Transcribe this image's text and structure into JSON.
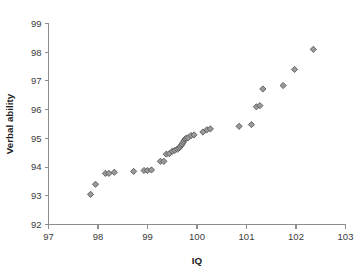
{
  "chart_data": {
    "type": "scatter",
    "title": "",
    "xlabel": "IQ",
    "ylabel": "Verbal ability",
    "xlim": [
      97,
      103
    ],
    "ylim": [
      92,
      99
    ],
    "xticks": [
      97,
      98,
      99,
      100,
      101,
      102,
      103
    ],
    "yticks": [
      92,
      93,
      94,
      95,
      96,
      97,
      98,
      99
    ],
    "xtick_labels": [
      "97",
      "98",
      "99",
      "100",
      "101",
      "102",
      "103"
    ],
    "ytick_labels": [
      "92",
      "93",
      "94",
      "95",
      "96",
      "97",
      "98",
      "99"
    ],
    "grid": false,
    "legend": null,
    "marker": "diamond",
    "marker_fill": "#9a9a9a",
    "marker_stroke": "#5a5a5a",
    "axis_color": "#8d8d8d",
    "background": "#ffffff",
    "n_points": 40,
    "points": [
      {
        "x": 97.85,
        "y": 93.05
      },
      {
        "x": 97.95,
        "y": 93.4
      },
      {
        "x": 98.15,
        "y": 93.78
      },
      {
        "x": 98.22,
        "y": 93.78
      },
      {
        "x": 98.33,
        "y": 93.82
      },
      {
        "x": 98.72,
        "y": 93.85
      },
      {
        "x": 98.93,
        "y": 93.88
      },
      {
        "x": 99.0,
        "y": 93.88
      },
      {
        "x": 99.08,
        "y": 93.9
      },
      {
        "x": 99.26,
        "y": 94.2
      },
      {
        "x": 99.33,
        "y": 94.2
      },
      {
        "x": 99.38,
        "y": 94.45
      },
      {
        "x": 99.44,
        "y": 94.47
      },
      {
        "x": 99.5,
        "y": 94.55
      },
      {
        "x": 99.55,
        "y": 94.58
      },
      {
        "x": 99.6,
        "y": 94.62
      },
      {
        "x": 99.63,
        "y": 94.66
      },
      {
        "x": 99.66,
        "y": 94.7
      },
      {
        "x": 99.68,
        "y": 94.76
      },
      {
        "x": 99.7,
        "y": 94.8
      },
      {
        "x": 99.72,
        "y": 94.86
      },
      {
        "x": 99.74,
        "y": 94.92
      },
      {
        "x": 99.76,
        "y": 94.97
      },
      {
        "x": 99.78,
        "y": 95.0
      },
      {
        "x": 99.82,
        "y": 95.02
      },
      {
        "x": 99.88,
        "y": 95.1
      },
      {
        "x": 99.94,
        "y": 95.12
      },
      {
        "x": 100.12,
        "y": 95.22
      },
      {
        "x": 100.2,
        "y": 95.3
      },
      {
        "x": 100.27,
        "y": 95.33
      },
      {
        "x": 100.85,
        "y": 95.42
      },
      {
        "x": 101.1,
        "y": 95.48
      },
      {
        "x": 101.2,
        "y": 96.1
      },
      {
        "x": 101.27,
        "y": 96.14
      },
      {
        "x": 101.33,
        "y": 96.72
      },
      {
        "x": 101.74,
        "y": 96.84
      },
      {
        "x": 101.97,
        "y": 97.4
      },
      {
        "x": 102.35,
        "y": 98.1
      }
    ]
  }
}
